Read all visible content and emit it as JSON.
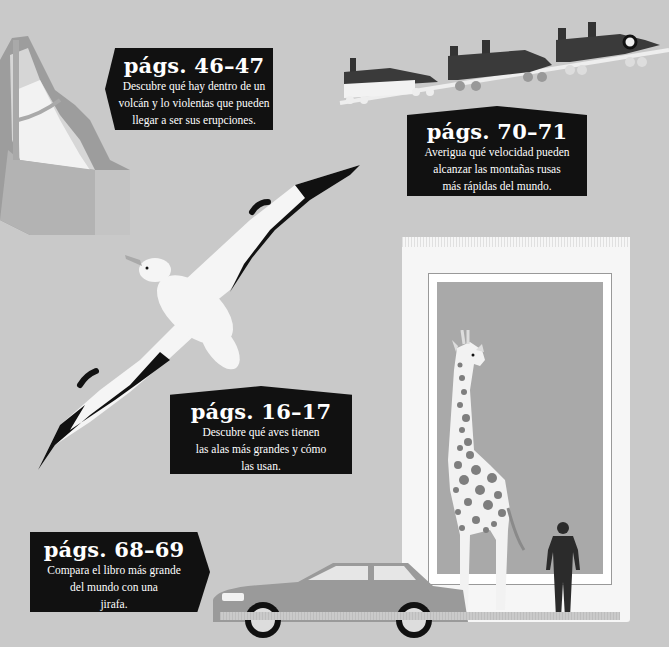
{
  "colors": {
    "background": "#c9c9c9",
    "label_bg": "#111111",
    "label_text": "#ffffff",
    "book_page": "#f6f6f6",
    "book_inner": "#a9a9a9",
    "car": "#9a9a9a",
    "giraffe_spots": "#7e7e7e"
  },
  "labels": [
    {
      "id": "volcano",
      "title": "págs. 46–47",
      "lines": [
        "Descubre qué hay dentro de un",
        "volcán y lo violentas que pueden",
        "llegar a ser sus erupciones."
      ]
    },
    {
      "id": "rollercoaster",
      "title": "págs. 70–71",
      "lines": [
        "Averigua qué velocidad pueden",
        "alcanzar las montañas rusas",
        "más rápidas del mundo."
      ]
    },
    {
      "id": "albatross",
      "title": "págs. 16–17",
      "lines": [
        "Descubre qué aves tienen",
        "las alas más grandes y cómo",
        "las usan."
      ]
    },
    {
      "id": "book",
      "title": "págs. 68–69",
      "lines": [
        "Compara el libro más grande",
        "del mundo con una",
        "jirafa."
      ]
    }
  ],
  "illustrations": {
    "volcano": "volcano-cross-section",
    "rollercoaster": "rollercoaster-cars",
    "albatross": "albatross-bird",
    "book": "giant-book",
    "giraffe": "giraffe",
    "car": "sedan-car",
    "human": "human-silhouette"
  }
}
